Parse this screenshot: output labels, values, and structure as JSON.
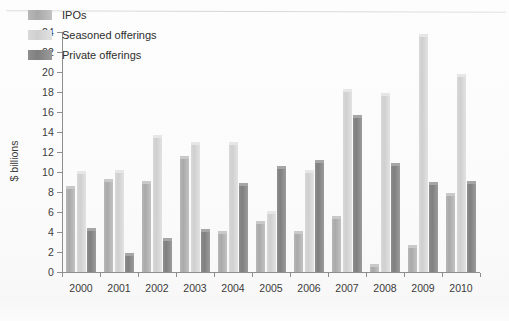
{
  "chart_data": {
    "type": "bar",
    "title": "",
    "subtitle": "",
    "xlabel": "",
    "ylabel": "$ billions",
    "ylim": [
      0,
      24
    ],
    "ytick_step": 2,
    "yticks": [
      0,
      2,
      4,
      6,
      8,
      10,
      12,
      14,
      16,
      18,
      20,
      22,
      24
    ],
    "grid": false,
    "legend_position": "top-left",
    "categories": [
      "2000",
      "2001",
      "2002",
      "2003",
      "2004",
      "2005",
      "2006",
      "2007",
      "2008",
      "2009",
      "2010"
    ],
    "series": [
      {
        "name": "IPOs",
        "color": "#b0b0b0",
        "values": [
          8.6,
          9.3,
          9.1,
          11.6,
          4.1,
          5.1,
          4.1,
          5.6,
          0.8,
          2.7,
          7.9
        ]
      },
      {
        "name": "Seasoned offerings",
        "color": "#d4d4d4",
        "values": [
          10.1,
          10.2,
          13.7,
          13.0,
          13.0,
          6.1,
          10.2,
          18.3,
          17.9,
          23.8,
          19.8
        ]
      },
      {
        "name": "Private offerings",
        "color": "#858585",
        "values": [
          4.4,
          1.9,
          3.4,
          4.3,
          8.9,
          10.6,
          11.2,
          15.7,
          10.9,
          9.0,
          9.1
        ]
      }
    ]
  },
  "legend": {
    "items": [
      {
        "label": "IPOs"
      },
      {
        "label": "Seasoned offerings"
      },
      {
        "label": "Private offerings"
      }
    ]
  },
  "axis": {
    "y_title": "$ billions"
  }
}
